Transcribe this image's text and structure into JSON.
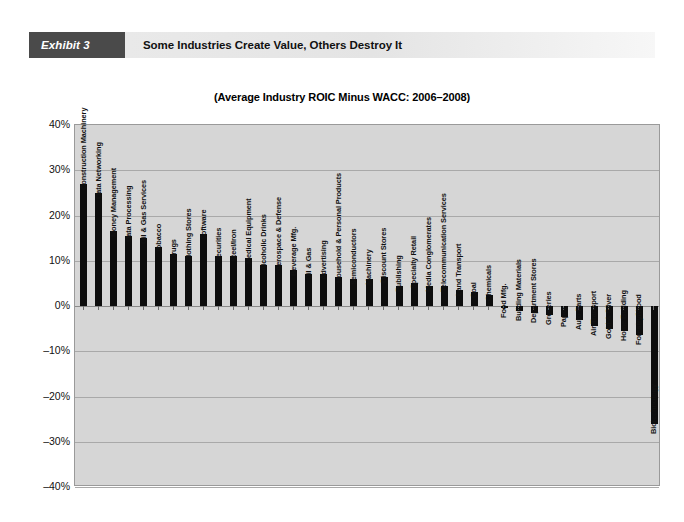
{
  "exhibit": {
    "tag": "Exhibit 3",
    "title": "Some Industries Create Value, Others Destroy It",
    "tag_bg": "#4a4a4a",
    "band_bg": "#e9e9e9"
  },
  "chart_data": {
    "type": "bar",
    "title": "(Average Industry ROIC Minus WACC: 2006–2008)",
    "xlabel": "",
    "ylabel": "",
    "ylim": [
      -40,
      40
    ],
    "ytick_labels": [
      "40%",
      "30%",
      "20%",
      "10%",
      "0%",
      "–10%",
      "–20%",
      "–30%",
      "–40%"
    ],
    "ytick_values": [
      40,
      30,
      20,
      10,
      0,
      -10,
      -20,
      -30,
      -40
    ],
    "grid": true,
    "legend": "none",
    "bar_color": "#0d0d0d",
    "plot_bg": "#d6d6d6",
    "categories": [
      "Construction Machinery",
      "Data Networking",
      "Money Management",
      "Data Processing",
      "Oil & Gas Services",
      "Tobacco",
      "Drugs",
      "Clothing Stores",
      "Software",
      "Securities",
      "Steel/Iron",
      "Medical Equipment",
      "Alcoholic Drinks",
      "Aerospace & Defense",
      "Beverage Mfg.",
      "Oil & Gas",
      "Advertising",
      "Household & Personal Products",
      "Semiconductors",
      "Machinery",
      "Discount Stores",
      "Publishing",
      "Specialty Retail",
      "Media Conglomerates",
      "Telecommunication Services",
      "Land Transport",
      "Coal",
      "Chemicals",
      "Food Mfg.",
      "Building Materials",
      "Department Stores",
      "Groceries",
      "Paper",
      "Auto Parts",
      "Air Transport",
      "Gold & Silver",
      "Home Building",
      "Forestry/Wood",
      "Biotechnology"
    ],
    "values": [
      27.0,
      25.0,
      16.5,
      15.5,
      15.0,
      13.0,
      11.5,
      11.0,
      16.0,
      11.0,
      11.0,
      10.5,
      9.0,
      9.0,
      8.0,
      7.0,
      7.0,
      6.5,
      6.0,
      6.0,
      6.5,
      4.5,
      5.0,
      4.5,
      4.5,
      3.5,
      3.0,
      2.5,
      -0.5,
      -1.0,
      -1.5,
      -2.0,
      -2.5,
      -3.0,
      -4.5,
      -5.0,
      -5.5,
      -6.5,
      -26.0
    ]
  }
}
